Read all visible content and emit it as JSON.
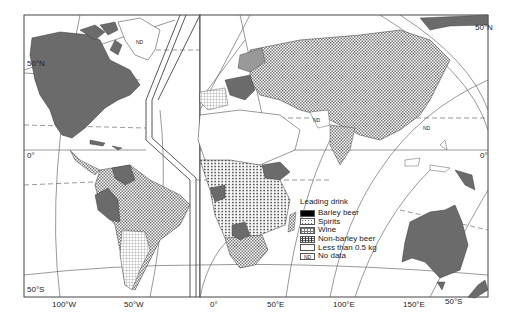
{
  "map": {
    "title": "Leading drink by country",
    "latitude_labels": {
      "left_50N": "50°N",
      "left_0": "0°",
      "left_50S": "50°S",
      "right_50N": "50°N",
      "right_0": "0°",
      "right_50S": "50°S"
    },
    "longitude_labels": {
      "lon_100W": "100°W",
      "lon_50W": "50°W",
      "lon_0": "0°",
      "lon_50E": "50°E",
      "lon_100E": "100°E",
      "lon_150E": "150°E"
    },
    "no_data_tags": [
      "ND",
      "ND",
      "ND"
    ],
    "colors": {
      "less_than_half_kg": "#6b6b6b",
      "barley_beer": "#000000",
      "border": "#333333",
      "background": "#ffffff"
    }
  },
  "legend": {
    "title": "Leading drink",
    "items": [
      {
        "key": "barley",
        "label": "Barley beer"
      },
      {
        "key": "spirits",
        "label": "Spirits"
      },
      {
        "key": "wine",
        "label": "Wine"
      },
      {
        "key": "nonbarley",
        "label": "Non-barley beer"
      },
      {
        "key": "less",
        "label": "Less than 0.5 kg"
      },
      {
        "key": "nd",
        "label": "No data",
        "tag": "ND"
      }
    ]
  }
}
